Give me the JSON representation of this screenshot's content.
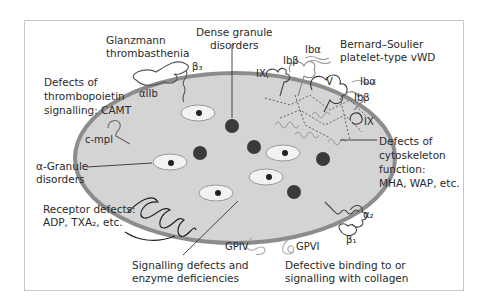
{
  "labels": {
    "glanzmann": "Glanzmann\nthrombasthenia",
    "beta3": "β₃",
    "alpha_IIb": "αIIb",
    "dense_granule": "Dense granule\ndisorders",
    "bernard_soulier": "Bernard–Soulier\nplatelet-type vWD",
    "ib_alpha_top": "Ibα",
    "ib_beta_top": "Ibβ",
    "ix_left": "IX",
    "v": "V",
    "ib_alpha_right": "Ibα",
    "ib_beta_right": "Ibβ",
    "ix_right": "IX",
    "thrombopoietin": "Defects of\nthrombopoietin\nsignalling: CAMT",
    "c_mpl": "c-mpl",
    "alpha_granule": "α-Granule\ndisorders",
    "cytoskeleton": "Defects of\ncytoskeleton\nfunction:\nMHA, WAP, etc.",
    "receptor_defects": "Receptor defects:\nADP, TXA₂, etc.",
    "alpha2": "α₂",
    "beta1": "β₁",
    "gpiv": "GPIV",
    "gpvi": "GPVI",
    "signalling": "Signalling defects and\nenzyme deficiencies",
    "collagen": "Defective binding to or\nsignalling with collagen"
  },
  "colors": {
    "cytoplasm": "#d4d4d4",
    "membrane": "#8c8c8c",
    "granule_dark": "#3a3a3a",
    "alpha_granule_fill": "#f2f2f2",
    "line": "#333333",
    "light_receptor": "#aaaaaa"
  }
}
